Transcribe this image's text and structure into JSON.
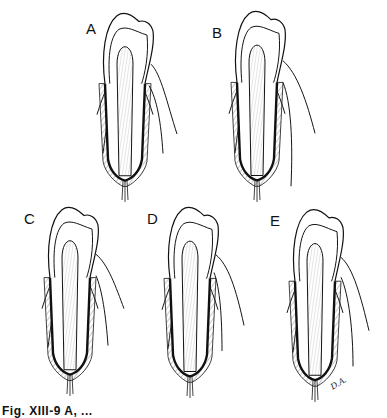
{
  "figure": {
    "type": "dental illustration",
    "panels": [
      {
        "label": "A",
        "description": "tooth in socket, uniform periodontal ligament"
      },
      {
        "label": "B",
        "description": "tooth in socket, ligament shifted"
      },
      {
        "label": "C",
        "description": "tooth in socket, ligament widened on one side"
      },
      {
        "label": "D",
        "description": "tooth in socket, narrow ligament"
      },
      {
        "label": "E",
        "description": "tooth in socket, widened ligament both sides"
      }
    ],
    "signature": "D.A.",
    "caption": "Fig. XIII-9  A, ..."
  }
}
